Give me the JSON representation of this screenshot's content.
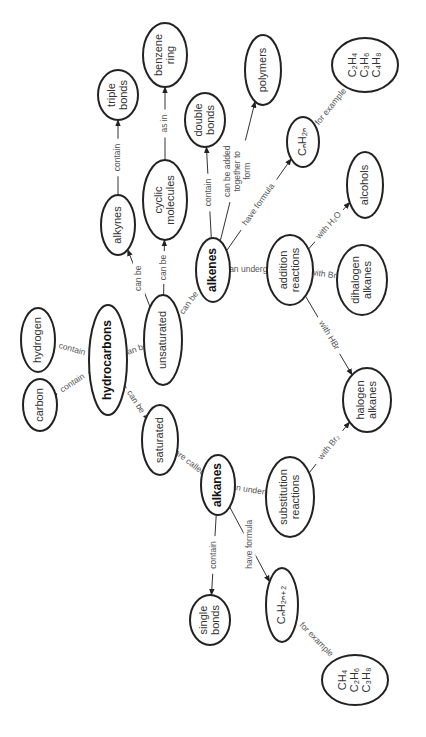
{
  "orientation": "rotated -90deg",
  "colors": {
    "background": "#ffffff",
    "stroke": "#222222",
    "text": "#333333"
  },
  "nodes": {
    "hydrocarbons": {
      "lines": [
        "hydrocarbons"
      ],
      "bold": true
    },
    "carbon": {
      "lines": [
        "carbon"
      ]
    },
    "hydrogen": {
      "lines": [
        "hydrogen"
      ]
    },
    "saturated": {
      "lines": [
        "saturated"
      ]
    },
    "unsaturated": {
      "lines": [
        "unsaturated"
      ]
    },
    "alkanes": {
      "lines": [
        "alkanes"
      ],
      "bold": true
    },
    "alkenes": {
      "lines": [
        "alkenes"
      ],
      "bold": true
    },
    "alkynes": {
      "lines": [
        "alkynes"
      ]
    },
    "cyclic_molecules": {
      "lines": [
        "cyclic",
        "molecules"
      ]
    },
    "benzene_ring": {
      "lines": [
        "benzene",
        "ring"
      ]
    },
    "triple_bonds": {
      "lines": [
        "triple",
        "bonds"
      ]
    },
    "double_bonds": {
      "lines": [
        "double",
        "bonds"
      ]
    },
    "single_bonds": {
      "lines": [
        "single",
        "bonds"
      ]
    },
    "polymers": {
      "lines": [
        "polymers"
      ]
    },
    "cnh2n": {
      "lines": [
        "CₙH₂ₙ"
      ]
    },
    "alkene_examples": {
      "lines": [
        "C₂H₄",
        "C₃H₆",
        "C₄H₈"
      ]
    },
    "alcohols": {
      "lines": [
        "alcohols"
      ]
    },
    "addition_reactions": {
      "lines": [
        "addition",
        "reactions"
      ]
    },
    "dihalogen_alkanes": {
      "lines": [
        "dihalogen",
        "alkanes"
      ]
    },
    "halogen_alkanes": {
      "lines": [
        "halogen",
        "alkanes"
      ]
    },
    "substitution_reactions": {
      "lines": [
        "substitution",
        "reactions"
      ]
    },
    "cnh2n2": {
      "lines": [
        "CₙH₂ₙ₊₂"
      ]
    },
    "alkane_examples": {
      "lines": [
        "CH₄",
        "C₂H₆",
        "C₃H₈"
      ]
    }
  },
  "edges": [
    {
      "from": "hydrocarbons",
      "to": "carbon",
      "label": "contain"
    },
    {
      "from": "hydrocarbons",
      "to": "hydrogen",
      "label": "contain"
    },
    {
      "from": "hydrocarbons",
      "to": "saturated",
      "label": "can be"
    },
    {
      "from": "hydrocarbons",
      "to": "unsaturated",
      "label": "can be"
    },
    {
      "from": "saturated",
      "to": "alkanes",
      "label": "are called"
    },
    {
      "from": "unsaturated",
      "to": "alkynes",
      "label": "can be"
    },
    {
      "from": "unsaturated",
      "to": "cyclic_molecules",
      "label": "can be"
    },
    {
      "from": "unsaturated",
      "to": "alkenes",
      "label": "can be"
    },
    {
      "from": "alkynes",
      "to": "triple_bonds",
      "label": "contain"
    },
    {
      "from": "cyclic_molecules",
      "to": "benzene_ring",
      "label": "as in"
    },
    {
      "from": "alkenes",
      "to": "double_bonds",
      "label": "contain"
    },
    {
      "from": "alkenes",
      "to": "polymers",
      "label": "can be added together to form"
    },
    {
      "from": "alkenes",
      "to": "cnh2n",
      "label": "have formula"
    },
    {
      "from": "alkenes",
      "to": "addition_reactions",
      "label": "can undergo"
    },
    {
      "from": "cnh2n",
      "to": "alkene_examples",
      "label": "for example"
    },
    {
      "from": "addition_reactions",
      "to": "alcohols",
      "label": "with H₂O"
    },
    {
      "from": "addition_reactions",
      "to": "dihalogen_alkanes",
      "label": "with Br₂"
    },
    {
      "from": "addition_reactions",
      "to": "halogen_alkanes",
      "label": "with HBr"
    },
    {
      "from": "alkanes",
      "to": "single_bonds",
      "label": "contain"
    },
    {
      "from": "alkanes",
      "to": "cnh2n2",
      "label": "have formula"
    },
    {
      "from": "alkanes",
      "to": "substitution_reactions",
      "label": "can undergo"
    },
    {
      "from": "substitution_reactions",
      "to": "halogen_alkanes",
      "label": "with Br₂"
    },
    {
      "from": "cnh2n2",
      "to": "alkane_examples",
      "label": "for example"
    }
  ]
}
